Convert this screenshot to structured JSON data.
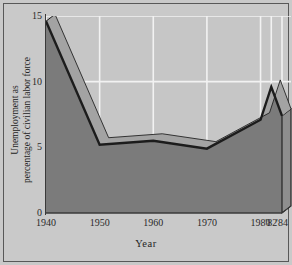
{
  "chart_data": {
    "type": "area",
    "title": "",
    "xlabel": "Year",
    "ylabel": "Unemployment as percentage of civilian labor force",
    "ylabel_line1": "Unemployment as",
    "ylabel_line2": "percentage of civilian labor force",
    "x": [
      1940,
      1950,
      1960,
      1970,
      1980,
      1982,
      1984
    ],
    "values": [
      14.6,
      5.2,
      5.5,
      4.9,
      7.1,
      9.6,
      7.4
    ],
    "xtick_labels": [
      "1940",
      "1950",
      "1960",
      "1970",
      "1980",
      "'82",
      "'84"
    ],
    "xtick_values": [
      1940,
      1950,
      1960,
      1970,
      1980,
      1982,
      1984
    ],
    "ytick_labels": [
      "0",
      "5",
      "10",
      "15"
    ],
    "ytick_values": [
      0,
      5,
      10,
      15
    ],
    "xlim": [
      1940,
      1984
    ],
    "ylim": [
      0,
      15
    ],
    "grid": true,
    "gridlines_x": [
      1940,
      1950,
      1960,
      1970,
      1980,
      1982,
      1984
    ],
    "gridlines_y": [
      5,
      10,
      15
    ],
    "legend": "none",
    "style": "3d-filled-area",
    "colors": {
      "plot_background": "#c6c6c6",
      "figure_background": "#c9c9c9",
      "area_fill": "#7b7b7b",
      "area_top_bevel": "#a3a3a3",
      "area_side_bevel": "#8e8e8e",
      "outline": "#1c1c1c",
      "gridline": "#f2f2f2",
      "axis": "#3a3a3a",
      "text": "#242424",
      "frame_border": "#585858"
    }
  }
}
